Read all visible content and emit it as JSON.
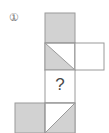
{
  "figure": {
    "label": "①",
    "question_mark": "?",
    "colors": {
      "fill_gray": "#d2d2d2",
      "fill_white": "#ffffff",
      "stroke": "#9a9a9a",
      "background": "#ffffff",
      "label_text": "#6d6d6d",
      "question_text": "#4a4a4a"
    },
    "grid": {
      "cell_size": 30,
      "origin_x": 45,
      "origin_y": 13
    },
    "cells": [
      {
        "name": "cell-top-center",
        "col": 0,
        "row": 0,
        "x": 45,
        "y": 13,
        "pattern": "solid-gray",
        "description": "fully shaded square"
      },
      {
        "name": "cell-middle-center",
        "col": 0,
        "row": 1,
        "x": 45,
        "y": 43,
        "pattern": "diagonal-tl-br-lower-left-gray",
        "description": "square split by diagonal from top-left to bottom-right, lower-left triangle shaded"
      },
      {
        "name": "cell-middle-right",
        "col": 1,
        "row": 1,
        "x": 75,
        "y": 43,
        "pattern": "empty-white",
        "description": "empty white square"
      },
      {
        "name": "cell-question",
        "col": 0,
        "row": 2,
        "x": 45,
        "y": 70,
        "pattern": "question",
        "description": "unknown cell marked with a question mark"
      },
      {
        "name": "cell-bottom-left",
        "col": -1,
        "row": 3,
        "x": 15,
        "y": 103,
        "pattern": "solid-gray",
        "description": "fully shaded square"
      },
      {
        "name": "cell-bottom-center",
        "col": 0,
        "row": 3,
        "x": 45,
        "y": 103,
        "pattern": "diagonal-bl-tr-upper-right-gray",
        "description": "square split by diagonal from bottom-left to top-right, upper-right triangle shaded"
      }
    ]
  }
}
